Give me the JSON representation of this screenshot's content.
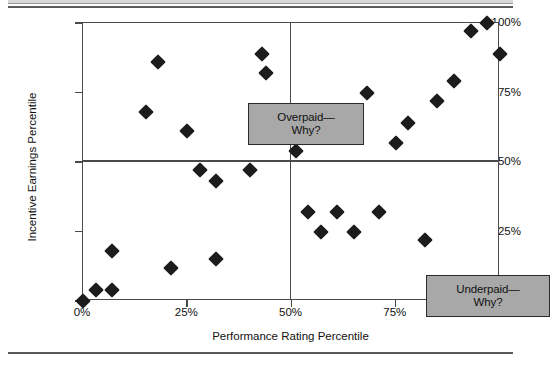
{
  "chart_data": {
    "type": "scatter",
    "title": "",
    "xlabel": "Performance Rating Percentile",
    "ylabel": "Incentive Earnings Percentile",
    "xlim": [
      0,
      100
    ],
    "ylim": [
      0,
      100
    ],
    "xticks": [
      "0%",
      "25%",
      "50%",
      "75%",
      "100%"
    ],
    "xtick_values": [
      0,
      25,
      50,
      75,
      100
    ],
    "yticks": [
      "0%",
      "25%",
      "50%",
      "75%",
      "100%"
    ],
    "ytick_values": [
      0,
      25,
      50,
      75,
      100
    ],
    "grid": false,
    "legend": "none",
    "reference_lines": {
      "vertical_at_x": 50,
      "horizontal_at_y": 50
    },
    "series": [
      {
        "name": "Employees",
        "marker": "diamond",
        "color": "#1c1c1c",
        "points": [
          {
            "x": 0,
            "y": 0
          },
          {
            "x": 3,
            "y": 4
          },
          {
            "x": 7,
            "y": 4
          },
          {
            "x": 7,
            "y": 18
          },
          {
            "x": 15,
            "y": 68
          },
          {
            "x": 18,
            "y": 86
          },
          {
            "x": 21,
            "y": 12
          },
          {
            "x": 25,
            "y": 61
          },
          {
            "x": 28,
            "y": 47
          },
          {
            "x": 32,
            "y": 15
          },
          {
            "x": 32,
            "y": 43
          },
          {
            "x": 40,
            "y": 47
          },
          {
            "x": 43,
            "y": 89
          },
          {
            "x": 44,
            "y": 82
          },
          {
            "x": 51,
            "y": 54
          },
          {
            "x": 54,
            "y": 32
          },
          {
            "x": 57,
            "y": 25
          },
          {
            "x": 61,
            "y": 32
          },
          {
            "x": 65,
            "y": 25
          },
          {
            "x": 68,
            "y": 75
          },
          {
            "x": 71,
            "y": 32
          },
          {
            "x": 75,
            "y": 57
          },
          {
            "x": 78,
            "y": 64
          },
          {
            "x": 82,
            "y": 22
          },
          {
            "x": 85,
            "y": 72
          },
          {
            "x": 89,
            "y": 79
          },
          {
            "x": 93,
            "y": 97
          },
          {
            "x": 97,
            "y": 100
          },
          {
            "x": 100,
            "y": 89
          }
        ]
      }
    ],
    "annotations": [
      {
        "id": "overpaid",
        "lines": [
          "Overpaid—",
          "Why?"
        ],
        "quadrant": "upper-left",
        "fill": "#a8a8a8",
        "border": "#2b2b2b"
      },
      {
        "id": "underpaid",
        "lines": [
          "Underpaid—",
          "Why?"
        ],
        "quadrant": "lower-right",
        "fill": "#a8a8a8",
        "border": "#2b2b2b"
      }
    ]
  }
}
